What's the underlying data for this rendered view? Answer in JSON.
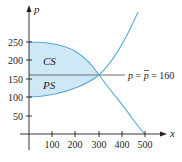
{
  "chart_data": {
    "type": "line",
    "title": "",
    "xlabel": "x",
    "ylabel": "p",
    "xlim": [
      0,
      520
    ],
    "ylim": [
      0,
      300
    ],
    "x_ticks": [
      100,
      200,
      300,
      400,
      500
    ],
    "y_ticks": [
      50,
      100,
      150,
      200,
      250
    ],
    "grid": false,
    "series": [
      {
        "name": "demand",
        "x": [
          0,
          100,
          200,
          300,
          400,
          500
        ],
        "values": [
          250,
          240,
          210,
          160,
          90,
          0
        ]
      },
      {
        "name": "supply",
        "x": [
          0,
          100,
          200,
          300,
          400,
          470
        ],
        "values": [
          100,
          107,
          127,
          160,
          230,
          330
        ]
      }
    ],
    "equilibrium": {
      "x": 300,
      "p": 160
    },
    "horizontal_line": {
      "p": 160,
      "label": "p = p̄ = 160"
    },
    "regions": [
      {
        "name": "CS",
        "label": "CS",
        "between": [
          "demand",
          "p=160"
        ],
        "x_range": [
          0,
          300
        ]
      },
      {
        "name": "PS",
        "label": "PS",
        "between": [
          "p=160",
          "supply"
        ],
        "x_range": [
          0,
          300
        ]
      }
    ],
    "colors": {
      "curve": "#5aa9d6",
      "fill": "#cfe8f6",
      "axis": "#231f20",
      "hline": "#6d6e71"
    }
  },
  "labels": {
    "x_axis": "x",
    "y_axis": "p",
    "cs": "CS",
    "ps": "PS",
    "eq_p1": "p",
    "eq_eq1": " = ",
    "eq_pbar": "p",
    "eq_eq2": " = 160",
    "x_ticks": [
      "100",
      "200",
      "300",
      "400",
      "500"
    ],
    "y_ticks": [
      "250",
      "200",
      "150",
      "100",
      "50"
    ]
  }
}
